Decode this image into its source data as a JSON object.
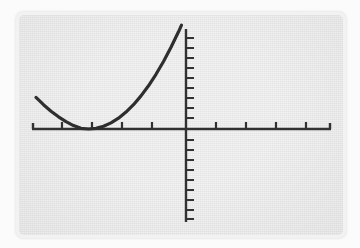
{
  "figure": {
    "kind": "graphing-calculator-screen",
    "screen_background_color": "#e9e9e9",
    "bezel_color": "#f2f2f2",
    "page_background_color": "#fbfbfb",
    "ink_color": "#161616",
    "axis_color": "#1a1a1a"
  },
  "chart_data": {
    "type": "line",
    "title": "",
    "subtitle": "",
    "xlabel": "",
    "ylabel": "",
    "legend": [],
    "legend_position": "none",
    "grid": false,
    "axis_labels_shown": false,
    "tick_labels": [],
    "annotations": [],
    "xlim": [
      -10,
      10
    ],
    "ylim": [
      -10,
      10
    ],
    "x_tick_step": 1,
    "y_tick_step": 1,
    "x_tick_values": [
      -10,
      -9,
      -8,
      -7,
      -6,
      -5,
      -4,
      -3,
      -2,
      -1,
      0,
      1,
      2,
      3,
      4,
      5,
      6,
      7,
      8,
      9,
      10
    ],
    "y_tick_values": [
      -10,
      -9,
      -8,
      -7,
      -6,
      -5,
      -4,
      -3,
      -2,
      -1,
      0,
      1,
      2,
      3,
      4,
      5,
      6,
      7,
      8,
      9,
      10
    ],
    "x_ticks_drawn": [
      -10,
      -8,
      -6,
      -4,
      -2,
      2,
      4,
      6,
      8,
      10
    ],
    "series": [
      {
        "name": "parabola",
        "vertex": [
          -6.5,
          0
        ],
        "leading_coefficient": 0.27,
        "equation": "y = 0.27 (x + 6.5)^2",
        "x": [
          -10.0,
          -9.5,
          -9.0,
          -8.5,
          -8.0,
          -7.5,
          -7.0,
          -6.5,
          -6.0,
          -5.5,
          -5.0,
          -4.5,
          -4.0,
          -3.5,
          -3.0,
          -2.5,
          -2.0,
          -1.5,
          -1.0,
          -0.5,
          -0.3
        ],
        "values": [
          3.16,
          2.43,
          1.78,
          1.22,
          0.74,
          0.34,
          0.07,
          0.0,
          0.07,
          0.27,
          0.61,
          1.08,
          1.69,
          2.43,
          3.31,
          4.32,
          5.47,
          6.75,
          8.17,
          9.72,
          10.39
        ]
      }
    ]
  }
}
